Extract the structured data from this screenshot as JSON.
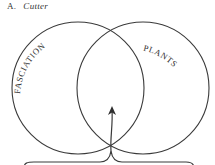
{
  "figure": {
    "marker": "A.",
    "author": "Cutter"
  },
  "venn": {
    "sets": [
      {
        "id": "left",
        "label": "FASCIATION"
      },
      {
        "id": "right",
        "label": "PLANTS"
      }
    ],
    "intersection_indicator": "arrow-from-brace"
  },
  "colors": {
    "stroke": "#3a3a3a",
    "background": "#ffffff"
  }
}
